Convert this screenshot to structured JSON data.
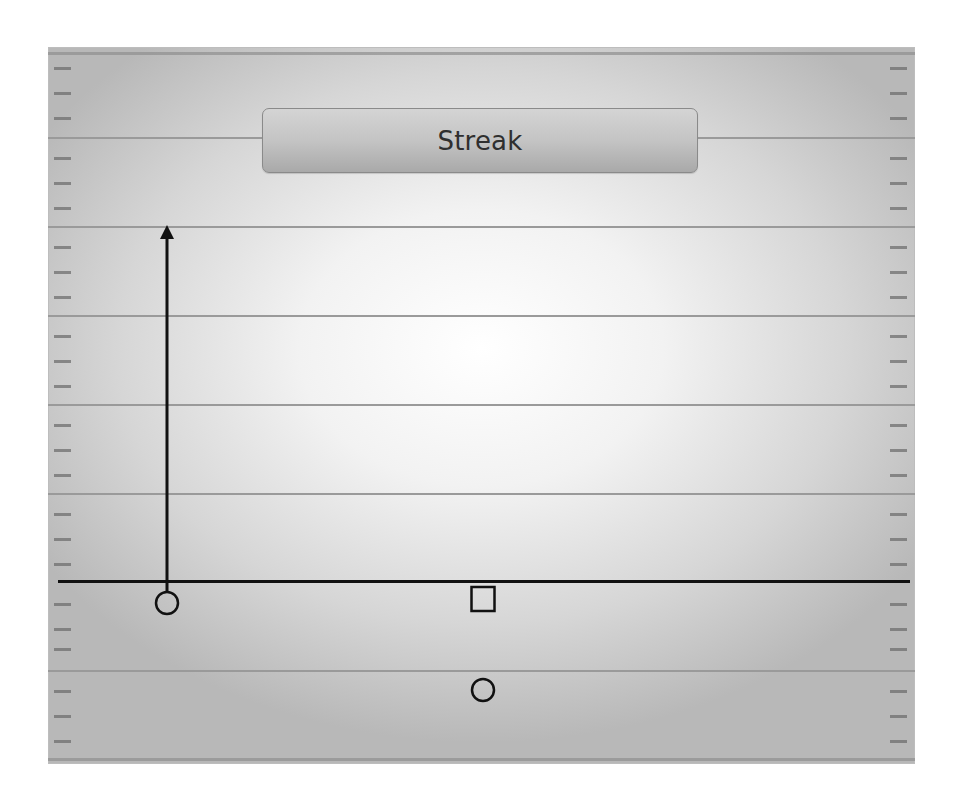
{
  "play": {
    "title": "Streak",
    "route_name": "Streak"
  },
  "field": {
    "yard_lines_y": [
      90,
      179,
      268,
      357,
      446,
      623
    ],
    "line_of_scrimmage_y": 533,
    "hash_ys": [
      20,
      45,
      70,
      110,
      135,
      160,
      199,
      224,
      249,
      288,
      313,
      338,
      377,
      402,
      427,
      466,
      491,
      516,
      556,
      581,
      601,
      643,
      668,
      693
    ],
    "colors": {
      "line_of_scrimmage": "#111111",
      "yard_line": "#9a9a9a",
      "hash": "#6f6f6f"
    }
  },
  "players": [
    {
      "role": "receiver",
      "shape": "circle",
      "x": 119,
      "y": 556
    },
    {
      "role": "center",
      "shape": "square",
      "x": 435,
      "y": 552
    },
    {
      "role": "quarterback",
      "shape": "circle",
      "x": 435,
      "y": 643
    }
  ],
  "routes": [
    {
      "name": "streak",
      "from": [
        119,
        545
      ],
      "to": [
        119,
        178
      ],
      "arrow": true
    }
  ]
}
